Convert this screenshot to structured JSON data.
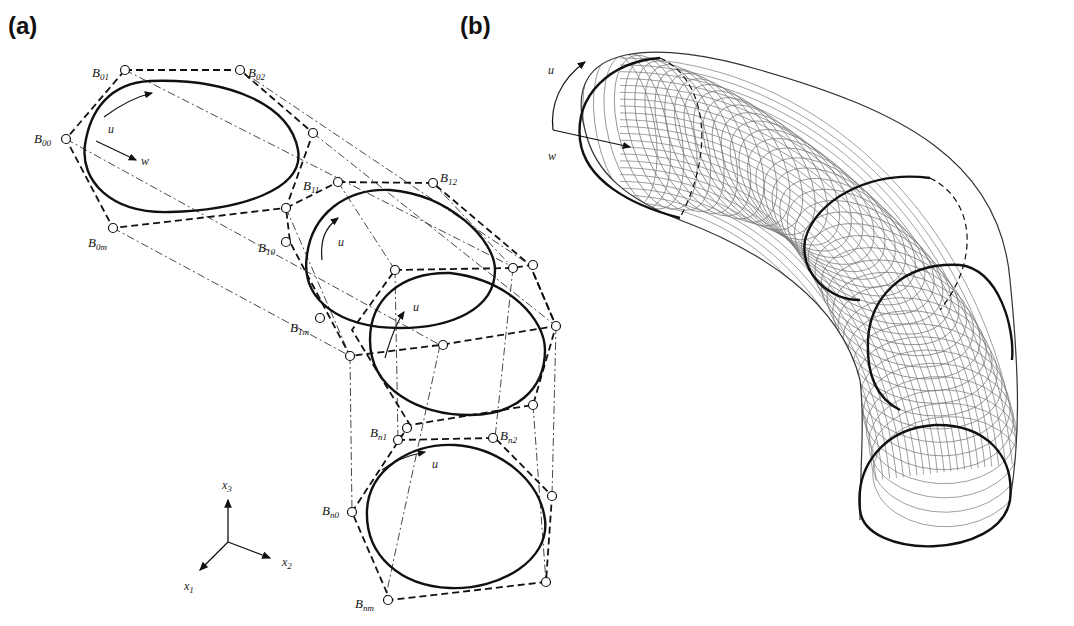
{
  "figure": {
    "panels": [
      {
        "id": "a",
        "label": "(a)"
      },
      {
        "id": "b",
        "label": "(b)"
      }
    ],
    "panel_a": {
      "control_points": [
        {
          "name": "B",
          "sub": "01"
        },
        {
          "name": "B",
          "sub": "02"
        },
        {
          "name": "B",
          "sub": "00"
        },
        {
          "name": "B",
          "sub": "0m"
        },
        {
          "name": "B",
          "sub": "11"
        },
        {
          "name": "B",
          "sub": "12"
        },
        {
          "name": "B",
          "sub": "10"
        },
        {
          "name": "B",
          "sub": "1m"
        },
        {
          "name": "B",
          "sub": "n1"
        },
        {
          "name": "B",
          "sub": "n2"
        },
        {
          "name": "B",
          "sub": "n0"
        },
        {
          "name": "B",
          "sub": "nm"
        }
      ],
      "params": {
        "u": "u",
        "w": "w"
      },
      "axes": {
        "x1": "x",
        "x1_sub": "1",
        "x2": "x",
        "x2_sub": "2",
        "x3": "x",
        "x3_sub": "3"
      }
    },
    "panel_b": {
      "params": {
        "u": "u",
        "w": "w"
      }
    }
  }
}
